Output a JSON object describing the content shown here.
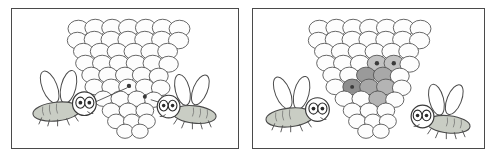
{
  "figure": {
    "panel_count": 2,
    "background_color": "#ffffff",
    "frame_color": "#4a4a4a"
  },
  "palette": {
    "outline": "#3a3a3a",
    "cell_fill": "#fdfdfd",
    "cell_stroke": "#555555",
    "fly_body_fill": "#c9cdc4",
    "fly_body_stroke": "#4a4a4a",
    "fly_wing_fill": "#ffffff",
    "fly_wing_stroke": "#4a4a4a",
    "fly_eye_fill": "#ffffff",
    "fly_eye_stroke": "#3a3a3a",
    "pupil_fill": "#2a2a2a",
    "egg_dot_fill": "#3a3a3a",
    "shaded_cell_dark": "#8e8e8e",
    "shaded_cell_mid": "#a8a8a8",
    "shaded_cell_light": "#c2c2c2",
    "pointer_line": "#4a4a4a"
  },
  "panels": [
    {
      "id": "panel-left",
      "label": "left-panel",
      "nest": {
        "name": "wasp-nest-comb",
        "shape": "inverted-cone",
        "rows": [
          7,
          7,
          6,
          6,
          5,
          5,
          4,
          3,
          3,
          2
        ],
        "cell_count": 48,
        "shaded_cells": [],
        "egg_dots": [
          {
            "name": "egg-dot-1",
            "cx": 118,
            "cy": 78
          },
          {
            "name": "egg-dot-2",
            "cx": 134,
            "cy": 89
          }
        ]
      },
      "flies": [
        {
          "name": "fly-left",
          "facing": "right",
          "body_center": {
            "x": 48,
            "y": 104
          },
          "wings": 2,
          "eyes": 2,
          "legs": 5,
          "pointer_to": {
            "x": 116,
            "y": 80
          }
        },
        {
          "name": "fly-right",
          "facing": "left",
          "body_center": {
            "x": 204,
            "y": 107
          },
          "wings": 2,
          "eyes": 2,
          "legs": 5,
          "pointer_to": {
            "x": 140,
            "y": 92
          }
        }
      ]
    },
    {
      "id": "panel-right",
      "label": "right-panel",
      "nest": {
        "name": "wasp-nest-comb",
        "shape": "inverted-cone",
        "rows": [
          7,
          7,
          6,
          6,
          5,
          5,
          4,
          3,
          3,
          2
        ],
        "cell_count": 48,
        "shaded_cells": [
          {
            "name": "shaded-cell-1",
            "tone": "dark"
          },
          {
            "name": "shaded-cell-2",
            "tone": "mid"
          },
          {
            "name": "shaded-cell-3",
            "tone": "mid"
          },
          {
            "name": "shaded-cell-4",
            "tone": "light"
          },
          {
            "name": "shaded-cell-5",
            "tone": "mid"
          },
          {
            "name": "shaded-cell-6",
            "tone": "light"
          },
          {
            "name": "shaded-cell-7",
            "tone": "mid"
          }
        ],
        "egg_dots": [
          {
            "name": "egg-dot-1",
            "cx": 118,
            "cy": 58
          },
          {
            "name": "egg-dot-2",
            "cx": 136,
            "cy": 58
          }
        ]
      },
      "flies": [
        {
          "name": "fly-left",
          "facing": "right",
          "body_center": {
            "x": 38,
            "y": 110
          },
          "wings": 2,
          "eyes": 2,
          "legs": 5,
          "pointer_to": null
        },
        {
          "name": "fly-right",
          "facing": "left",
          "body_center": {
            "x": 200,
            "y": 116
          },
          "wings": 2,
          "eyes": 2,
          "legs": 5,
          "pointer_to": null
        }
      ]
    }
  ]
}
